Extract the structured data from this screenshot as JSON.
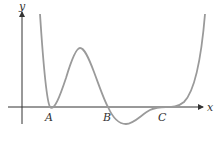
{
  "diagram": {
    "type": "function-graph",
    "axes": {
      "x_label": "x",
      "y_label": "y"
    },
    "points": [
      {
        "label": "A",
        "description": "double root, curve touches x-axis (local min)"
      },
      {
        "label": "B",
        "description": "simple root, curve crosses x-axis going down"
      },
      {
        "label": "C",
        "description": "triple root / inflection, curve flattens on x-axis"
      }
    ],
    "colors": {
      "curve": "#9a9a9a",
      "axes": "#333333"
    }
  }
}
